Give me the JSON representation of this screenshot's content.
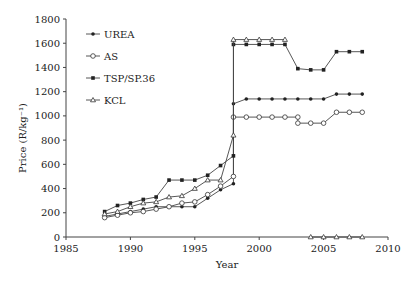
{
  "chart_data": {
    "type": "line",
    "title": "",
    "xlabel": "Year",
    "ylabel": "Price (R/kg⁻¹)",
    "xlim": [
      1985,
      2010
    ],
    "ylim": [
      0,
      1800
    ],
    "xticks": [
      1985,
      1990,
      1995,
      2000,
      2005,
      2010
    ],
    "yticks": [
      0,
      200,
      400,
      600,
      800,
      1000,
      1200,
      1400,
      1600,
      1800
    ],
    "grid": false,
    "legend_position": "upper-left",
    "series": [
      {
        "name": "UREA",
        "marker": "filled-circle",
        "x": [
          1988,
          1989,
          1990,
          1991,
          1992,
          1993,
          1994,
          1995,
          1996,
          1997,
          1998,
          1998,
          1999,
          2000,
          2001,
          2002,
          2003,
          2004,
          2005,
          2006,
          2007,
          2008
        ],
        "y": [
          170,
          190,
          210,
          230,
          250,
          250,
          250,
          250,
          320,
          390,
          440,
          1100,
          1140,
          1140,
          1140,
          1140,
          1140,
          1140,
          1140,
          1180,
          1180,
          1180
        ]
      },
      {
        "name": "AS",
        "marker": "open-circle",
        "x": [
          1988,
          1989,
          1990,
          1991,
          1992,
          1993,
          1994,
          1995,
          1996,
          1997,
          1998,
          1998,
          1999,
          2000,
          2001,
          2002,
          2003,
          2003,
          2004,
          2005,
          2006,
          2007,
          2008
        ],
        "y": [
          160,
          180,
          200,
          210,
          230,
          250,
          280,
          290,
          350,
          420,
          500,
          990,
          990,
          990,
          990,
          990,
          990,
          940,
          940,
          940,
          1030,
          1030,
          1030
        ]
      },
      {
        "name": "TSP/SP.36",
        "marker": "filled-square",
        "x": [
          1988,
          1989,
          1990,
          1991,
          1992,
          1993,
          1994,
          1995,
          1996,
          1997,
          1998,
          1998,
          1999,
          2000,
          2001,
          2002,
          2003,
          2004,
          2005,
          2006,
          2007,
          2008
        ],
        "y": [
          210,
          260,
          280,
          310,
          330,
          470,
          470,
          470,
          510,
          590,
          670,
          1590,
          1590,
          1590,
          1590,
          1590,
          1390,
          1380,
          1380,
          1530,
          1530,
          1530
        ]
      },
      {
        "name": "KCL",
        "marker": "open-triangle",
        "x": [
          1988,
          1989,
          1990,
          1991,
          1992,
          1993,
          1994,
          1995,
          1996,
          1997,
          1998,
          1998,
          1999,
          2000,
          2001,
          2002,
          2004,
          2005,
          2006,
          2007,
          2008
        ],
        "y": [
          190,
          210,
          250,
          280,
          290,
          330,
          340,
          400,
          470,
          470,
          840,
          1630,
          1630,
          1630,
          1630,
          1630,
          0,
          0,
          0,
          0,
          0
        ]
      }
    ]
  }
}
